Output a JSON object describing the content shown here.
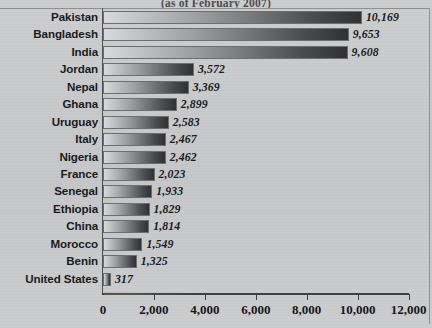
{
  "chart_data": {
    "type": "bar",
    "orientation": "horizontal",
    "title": "(as of February 2007)",
    "xlabel": "",
    "ylabel": "",
    "xlim": [
      0,
      12000
    ],
    "xticks": [
      "0",
      "2,000",
      "4,000",
      "6,000",
      "8,000",
      "10,000",
      "12,000"
    ],
    "xtick_values": [
      0,
      2000,
      4000,
      6000,
      8000,
      10000,
      12000
    ],
    "grid": false,
    "legend": "none",
    "categories": [
      "Pakistan",
      "Bangladesh",
      "India",
      "Jordan",
      "Nepal",
      "Ghana",
      "Uruguay",
      "Italy",
      "Nigeria",
      "France",
      "Senegal",
      "Ethiopia",
      "China",
      "Morocco",
      "Benin",
      "United States"
    ],
    "values": [
      10169,
      9653,
      9608,
      3572,
      3369,
      2899,
      2583,
      2467,
      2462,
      2023,
      1933,
      1829,
      1814,
      1549,
      1325,
      317
    ],
    "value_labels": [
      "10,169",
      "9,653",
      "9,608",
      "3,572",
      "3,369",
      "2,899",
      "2,583",
      "2,467",
      "2,462",
      "2,023",
      "1,933",
      "1,829",
      "1,814",
      "1,549",
      "1,325",
      "317"
    ],
    "colors": {
      "background": "#c9cacb",
      "bar_gradient_start": "#d8d9da",
      "bar_gradient_end": "#303133",
      "axis": "#3e3f41",
      "text": "#1b1b1d"
    }
  }
}
